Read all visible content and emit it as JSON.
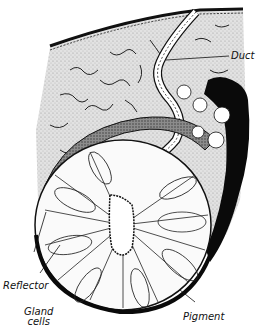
{
  "diagram": {
    "colors": {
      "background": "#ffffff",
      "tissue_fill": "#d9d9d9",
      "ink": "#111111",
      "pigment": "#0a0a0a"
    },
    "labels": {
      "duct": "Duct",
      "reflector": "Reflector",
      "gland_line1": "Gland",
      "gland_line2": "cells",
      "pigment": "Pigment"
    }
  }
}
